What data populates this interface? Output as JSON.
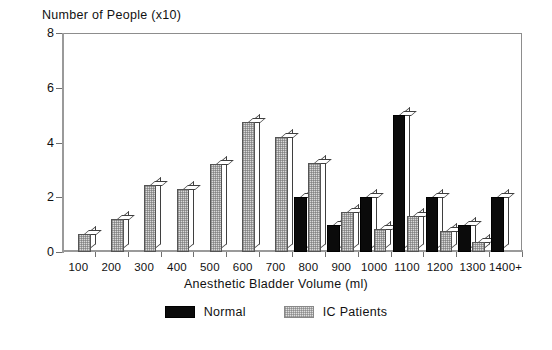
{
  "chart_data": {
    "type": "bar",
    "title": "",
    "ylabel": "Number of People (x10)",
    "xlabel": "Anesthetic Bladder Volume (ml)",
    "categories": [
      "100",
      "200",
      "300",
      "400",
      "500",
      "600",
      "700",
      "800",
      "900",
      "1000",
      "1100",
      "1200",
      "1300",
      "1400+"
    ],
    "series": [
      {
        "name": "Normal",
        "color": "#0b0b0b",
        "values": [
          0,
          0,
          0,
          0,
          0,
          0,
          0,
          2.0,
          1.0,
          2.0,
          5.0,
          2.0,
          1.0,
          2.0
        ]
      },
      {
        "name": "IC Patients",
        "color": "#d9d9d9",
        "values": [
          0.65,
          1.2,
          2.45,
          2.3,
          3.2,
          4.75,
          4.2,
          3.25,
          1.45,
          0.85,
          1.3,
          0.75,
          0.35,
          0
        ]
      }
    ],
    "ylim": [
      0,
      8
    ],
    "yticks": [
      0,
      2,
      4,
      6,
      8
    ],
    "ytick_labels": [
      "0",
      "2",
      "4",
      "6",
      "8"
    ],
    "grid": false,
    "legend_position": "bottom-center"
  },
  "legend": {
    "items": [
      {
        "label": "Normal",
        "swatch": "normal"
      },
      {
        "label": "IC Patients",
        "swatch": "ic"
      }
    ]
  }
}
